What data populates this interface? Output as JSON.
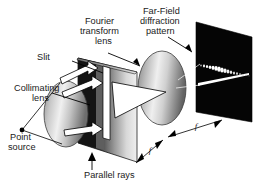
{
  "figure": {
    "background_color": "#ffffff",
    "width": 266,
    "height": 186
  },
  "labels": {
    "point_source": "Point\nsource",
    "point_source_line1": "Point",
    "point_source_line2": "source",
    "collimating_lens_line1": "Collimating",
    "collimating_lens_line2": "lens",
    "slit": "Slit",
    "parallel_rays": "Parallel rays",
    "fourier_lens_line1": "Fourier",
    "fourier_lens_line2": "transform",
    "fourier_lens_line3": "lens",
    "far_field_line1": "Far-Field",
    "far_field_line2": "diffraction",
    "far_field_line3": "pattern",
    "focal_length_1": "f",
    "focal_length_2": "f"
  },
  "colors": {
    "ink": "#1a1a1a",
    "outline": "#000000",
    "screen_black": "#050505",
    "lens_light": "#f2f2f2",
    "lens_mid": "#9c9c9c",
    "lens_dark": "#5a5a5a",
    "plane_light": "#ededed",
    "plane_dark": "#1c1c1c",
    "beam_white": "#ffffff"
  },
  "diffraction_pattern": {
    "description": "Row of bright spots decreasing in size along a diagonal line",
    "spot_count": 17,
    "bright_line": true
  },
  "elements": [
    {
      "name": "point-source",
      "kind": "vertex-dot"
    },
    {
      "name": "collimating-lens",
      "kind": "ellipse"
    },
    {
      "name": "slit-plane",
      "kind": "parallelogram"
    },
    {
      "name": "parallel-beam",
      "kind": "white-arrow-beam"
    },
    {
      "name": "fourier-transform-lens",
      "kind": "ellipse"
    },
    {
      "name": "converging-beam",
      "kind": "white-wedge"
    },
    {
      "name": "diffraction-screen",
      "kind": "black-parallelogram"
    },
    {
      "name": "focal-distance-arrow-1",
      "kind": "double-arrow"
    },
    {
      "name": "focal-distance-arrow-2",
      "kind": "double-arrow"
    }
  ]
}
